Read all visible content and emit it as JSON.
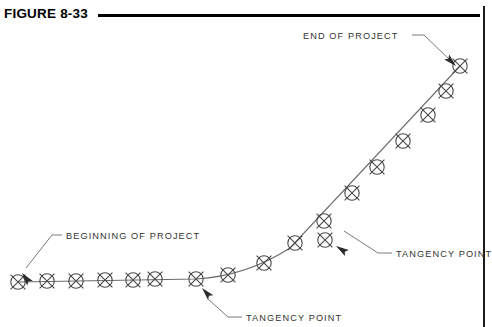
{
  "figure": {
    "title": "FIGURE 8-33",
    "rule_color": "#000000",
    "border_color": "#1a1a1a"
  },
  "diagram": {
    "type": "survey-route-alignment",
    "line_color": "#6b6b6b",
    "marker_color": "#4a4a4a",
    "leader_color": "#7a7a7a",
    "arrow_color": "#2b2b2b",
    "marker_radius": 7.2,
    "marker_cross_extent": 10.5,
    "labels": [
      {
        "id": "end-of-project",
        "text": "END OF PROJECT",
        "text_x": 303,
        "text_y": 39,
        "anchor": "start",
        "leader": "M 412 35 L 424 35 L 452 62",
        "arrow_tip_x": 456,
        "arrow_tip_y": 66,
        "arrow_angle": 44
      },
      {
        "id": "beginning-of-project",
        "text": "BEGINNING OF PROJECT",
        "text_x": 66,
        "text_y": 239,
        "anchor": "start",
        "leader": "M 62 235 L 52 235 L 26 268",
        "arrow_tip_x": 22,
        "arrow_tip_y": 273,
        "arrow_angle": 232
      },
      {
        "id": "tangency-point-upper",
        "text": "TANGENCY POINT",
        "text_x": 396,
        "text_y": 257,
        "anchor": "start",
        "leader": "M 392 253 L 378 253 L 344 231",
        "arrow_tip_x": 336,
        "arrow_tip_y": 246,
        "arrow_angle": 213
      },
      {
        "id": "tangency-point-lower",
        "text": "TANGENCY POINT",
        "text_x": 246,
        "text_y": 321,
        "anchor": "start",
        "leader": "M 242 317 L 228 317 L 208 299",
        "arrow_tip_x": 202,
        "arrow_tip_y": 288,
        "arrow_angle": 228
      }
    ],
    "alignment_path": "M 18 282 L 196 279 C 232 277 262 266 290 248 L 460 66",
    "stations": [
      {
        "x": 18,
        "y": 282,
        "name": "beginning-of-project-station"
      },
      {
        "x": 47,
        "y": 281,
        "name": "station"
      },
      {
        "x": 76,
        "y": 281,
        "name": "station"
      },
      {
        "x": 105,
        "y": 280,
        "name": "station"
      },
      {
        "x": 133,
        "y": 280,
        "name": "station"
      },
      {
        "x": 155,
        "y": 279,
        "name": "station"
      },
      {
        "x": 196,
        "y": 279,
        "name": "tangency-point-lower-station"
      },
      {
        "x": 228,
        "y": 275,
        "name": "station"
      },
      {
        "x": 264,
        "y": 263,
        "name": "station"
      },
      {
        "x": 295,
        "y": 243,
        "name": "station"
      },
      {
        "x": 325,
        "y": 240,
        "name": "tangency-point-upper-station"
      },
      {
        "x": 324,
        "y": 221,
        "name": "station"
      },
      {
        "x": 352,
        "y": 193,
        "name": "station"
      },
      {
        "x": 377,
        "y": 167,
        "name": "station"
      },
      {
        "x": 403,
        "y": 141,
        "name": "station"
      },
      {
        "x": 428,
        "y": 115,
        "name": "station"
      },
      {
        "x": 446,
        "y": 91,
        "name": "station"
      },
      {
        "x": 460,
        "y": 66,
        "name": "end-of-project-station"
      }
    ]
  }
}
